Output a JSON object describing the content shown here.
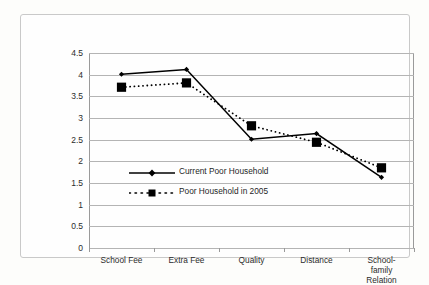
{
  "chart_data": {
    "type": "line",
    "title": "",
    "xlabel": "",
    "ylabel": "",
    "ylim": [
      0,
      4.5
    ],
    "yticks": [
      "0",
      "0.5",
      "1",
      "1.5",
      "2",
      "2.5",
      "3",
      "3.5",
      "4",
      "4.5"
    ],
    "grid": true,
    "legend_position": "inside-left-center",
    "categories": [
      "School Fee",
      "Extra Fee",
      "Quality",
      "Distance",
      "School-family\nRelation"
    ],
    "series": [
      {
        "name": "Current Poor Household",
        "style": "solid",
        "marker": "small-diamond",
        "color": "#000000",
        "values": [
          4.01,
          4.12,
          2.51,
          2.64,
          1.63
        ]
      },
      {
        "name": "Poor Household in 2005",
        "style": "dotted",
        "marker": "large-square",
        "color": "#000000",
        "values": [
          3.71,
          3.81,
          2.82,
          2.44,
          1.85
        ]
      }
    ]
  },
  "colors": {
    "page_background": "#fdfdfb",
    "frame_border": "#c9c9c9",
    "gridline": "#b4b4b4",
    "axis": "#9a9a9a",
    "text": "#2b2b2b",
    "series": "#000000"
  }
}
